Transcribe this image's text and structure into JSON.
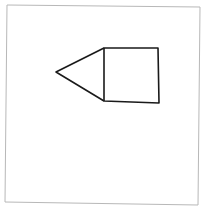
{
  "canvas": {
    "width": 205,
    "height": 215,
    "background": "#ffffff"
  },
  "frame": {
    "x1": 7,
    "y1": 5,
    "x2": 200,
    "y2": 205,
    "stroke": "#b8b8b8"
  },
  "shapes": {
    "square": {
      "points": "104,48 158,48 159,103 104,101",
      "stroke": "#1a1a1a"
    },
    "triangle": {
      "points": "104,48 56,72 104,101",
      "stroke": "#1a1a1a"
    }
  }
}
